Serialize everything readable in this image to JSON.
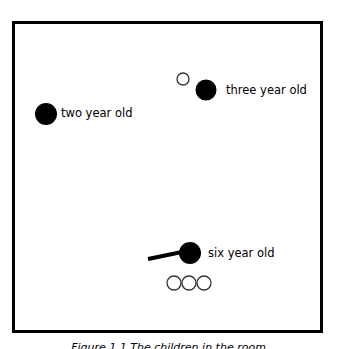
{
  "figure": {
    "frame_color": "#000000",
    "background": "#ffffff",
    "children": [
      {
        "label": "two year old",
        "dot": {
          "cx": 46,
          "cy": 114,
          "r": 11,
          "fill": "#000000"
        },
        "label_pos": {
          "x": 61,
          "y": 106
        }
      },
      {
        "label": "three year old",
        "dot": {
          "cx": 206,
          "cy": 90,
          "r": 10.5,
          "fill": "#000000"
        },
        "label_pos": {
          "x": 226,
          "y": 83
        }
      },
      {
        "label": "six year old",
        "dot": {
          "cx": 190,
          "cy": 253,
          "r": 11,
          "fill": "#000000"
        },
        "label_pos": {
          "x": 208,
          "y": 246
        }
      }
    ],
    "stick": {
      "x1": 148,
      "y1": 259,
      "x2": 182,
      "y2": 252,
      "width": 4
    },
    "hollow_circles": [
      {
        "cx": 183,
        "cy": 79,
        "r": 6
      },
      {
        "cx": 174,
        "cy": 283,
        "r": 7
      },
      {
        "cx": 189,
        "cy": 283,
        "r": 7
      },
      {
        "cx": 204,
        "cy": 283,
        "r": 7
      }
    ],
    "caption": "Figure 1.1 The children in the room"
  }
}
